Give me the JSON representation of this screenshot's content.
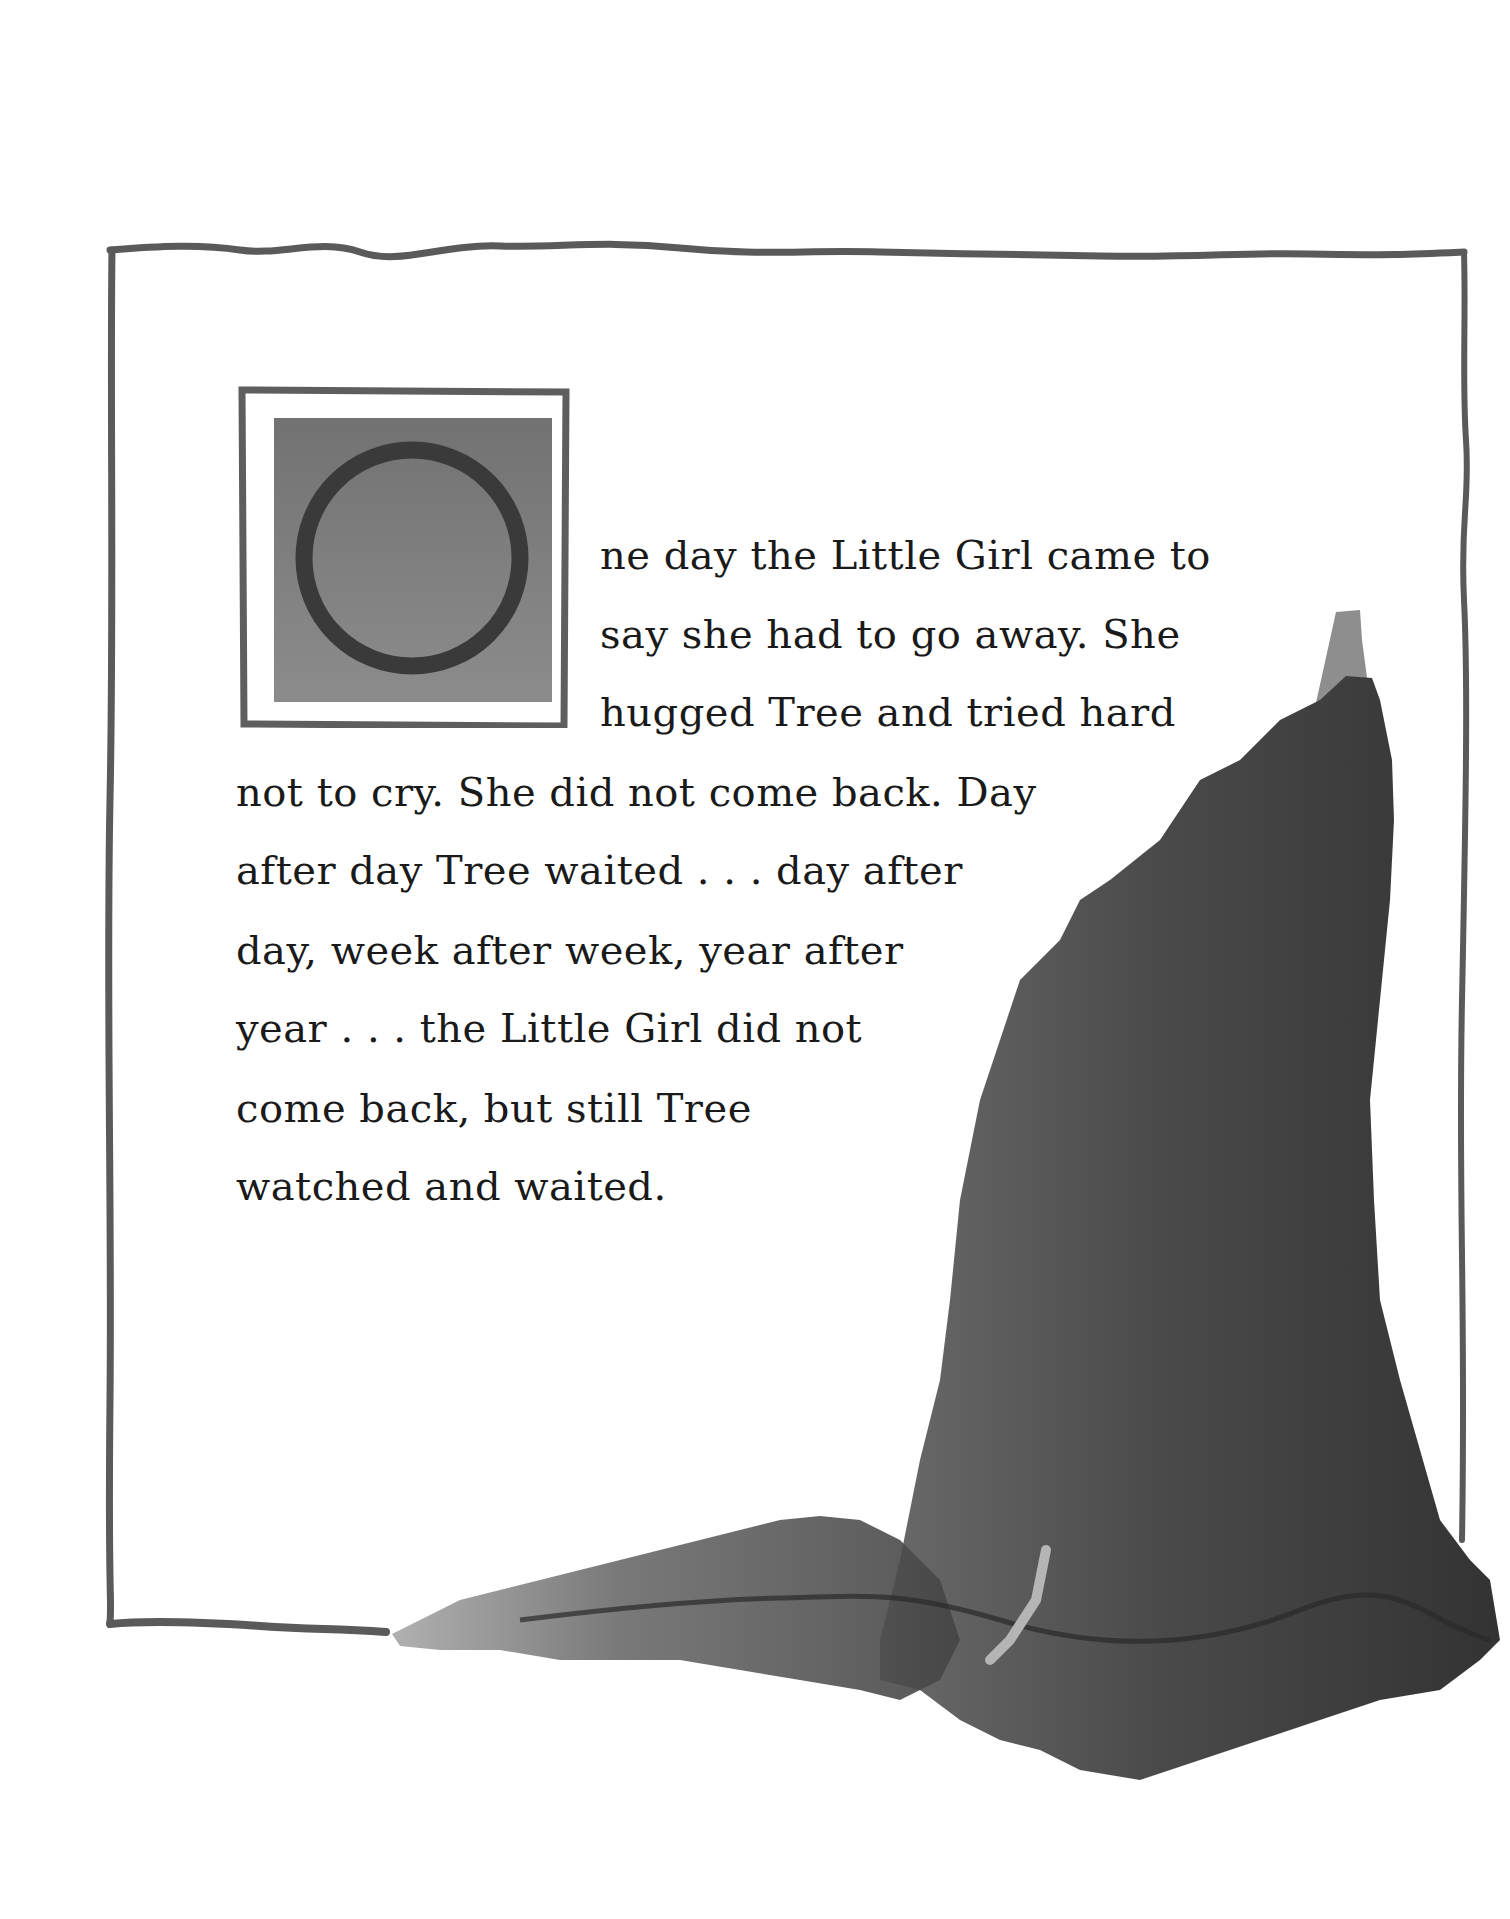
{
  "page": {
    "background": "#ffffff",
    "border_color": "#5a5a5a"
  },
  "drop_cap": {
    "letter": "O",
    "box_color": "#7a7a7a",
    "ring_color": "#3a3a3a"
  },
  "story": {
    "lines": [
      "ne day the Little Girl came to",
      "say she had to go away. She",
      "hugged Tree and tried hard",
      "not to cry. She did not come back. Day",
      "after day Tree waited . . . day after",
      "day, week after week, year after",
      "year . . . the Little Girl did not",
      "come back, but still Tree",
      "watched and waited."
    ]
  },
  "illustration": {
    "subject": "tree-trunk",
    "ink_dark": "#3c3c3c",
    "ink_mid": "#6a6a6a",
    "ink_light": "#9a9a9a"
  }
}
